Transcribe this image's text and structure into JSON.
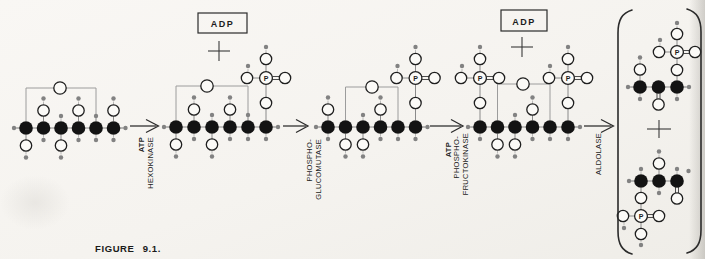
{
  "figure_caption": "FIGURE 9.1.",
  "adp_boxes": [
    {
      "label": "ADP"
    },
    {
      "label": "ADP"
    }
  ],
  "symbols": {
    "phosphorus": "P",
    "plus": "+"
  },
  "arrow_labels": [
    {
      "lines": [
        {
          "text": "ATP",
          "bold": true
        },
        {
          "text": "HEXOKINASE",
          "bold": false
        }
      ]
    },
    {
      "lines": [
        {
          "text": "PHOSPHO-",
          "bold": false
        },
        {
          "text": "GLUCOMUTASE",
          "bold": false
        }
      ]
    },
    {
      "lines": [
        {
          "text": "ATP",
          "bold": true
        },
        {
          "text": "PHOSPHO-",
          "bold": false
        },
        {
          "text": "FRUCTOKINASE",
          "bold": false
        }
      ]
    },
    {
      "lines": [
        {
          "text": "ALDOLASE",
          "bold": false
        }
      ]
    }
  ],
  "molecules": [
    {
      "name": "six-carbon-molecule-1",
      "y": 128,
      "cx": [
        26,
        43.5,
        61,
        78.5,
        96,
        113.5
      ],
      "ring": {
        "from": 0,
        "to": 4,
        "top": 88,
        "ox": 60
      },
      "up": [
        "",
        "Oh",
        "h",
        "Oh",
        "h",
        "Oh"
      ],
      "down": [
        "Oh",
        "h",
        "Oh",
        "h",
        "h",
        "h"
      ],
      "left": "h",
      "right": "h",
      "compact": false
    },
    {
      "name": "six-carbon-molecule-2",
      "y": 127,
      "cx": [
        176,
        194,
        212,
        230,
        248,
        266
      ],
      "ring": {
        "from": 0,
        "to": 4,
        "top": 86,
        "ox": 207
      },
      "up": [
        "",
        "Oh",
        "h",
        "Oh",
        "h",
        "P"
      ],
      "down": [
        "Oh",
        "h",
        "Oh",
        "h",
        "h",
        "h"
      ],
      "left": "h",
      "right": "h",
      "compact": false
    },
    {
      "name": "six-carbon-molecule-3",
      "y": 127,
      "cx": [
        328,
        345.5,
        363,
        380.5,
        398,
        415.5
      ],
      "ring": {
        "from": 1,
        "to": 4,
        "top": 87,
        "ox": 372
      },
      "up": [
        "Oh",
        "",
        "h",
        "Oh",
        "",
        "P"
      ],
      "down": [
        "h",
        "Oh",
        "Oh",
        "h",
        "h",
        "h"
      ],
      "left": "h",
      "right": "h",
      "compact": false
    },
    {
      "name": "six-carbon-molecule-4",
      "y": 127,
      "cx": [
        480,
        497.5,
        515,
        532.5,
        550,
        568
      ],
      "ring": {
        "from": 1,
        "to": 4,
        "top": 84,
        "ox": 523
      },
      "up": [
        "P",
        "",
        "h",
        "Oh",
        "",
        "P"
      ],
      "down": [
        "h",
        "Oh",
        "Oh",
        "h",
        "h",
        "h"
      ],
      "left": "h",
      "right": "h",
      "compact": false
    },
    {
      "name": "three-carbon-molecule-top",
      "y": 87,
      "cx": [
        640,
        658.5,
        677
      ],
      "up": [
        "Oh",
        "",
        "P"
      ],
      "down": [
        "h",
        "O=",
        "h"
      ],
      "left": "h",
      "right": "h",
      "compact": true
    },
    {
      "name": "three-carbon-molecule-bottom",
      "y": 181,
      "cx": [
        641,
        659,
        677
      ],
      "up": [
        "h",
        "Oh",
        "h"
      ],
      "down": [
        "P",
        "h",
        "O="
      ],
      "left": "h",
      "right": "",
      "compact": true,
      "extra_dots": [
        [
          688.5,
          171
        ]
      ]
    }
  ]
}
